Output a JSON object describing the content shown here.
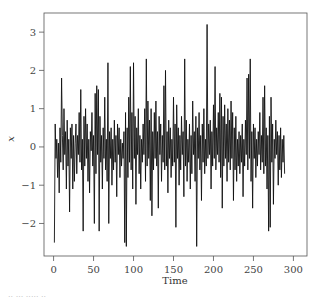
{
  "chart_data": {
    "type": "line",
    "title": "",
    "xlabel": "Time",
    "ylabel": "x",
    "xlim": [
      -12,
      317
    ],
    "ylim": [
      -2.85,
      3.5
    ],
    "xticks": [
      0,
      50,
      100,
      150,
      200,
      250,
      300
    ],
    "yticks": [
      -2,
      -1,
      0,
      1,
      2,
      3
    ],
    "xtick_labels": [
      "0",
      "50",
      "100",
      "150",
      "200",
      "250",
      "300"
    ],
    "ytick_labels": [
      "−2",
      "−1",
      "0",
      "1",
      "2",
      "3"
    ],
    "grid": false,
    "legend": null,
    "series": [
      {
        "name": "x",
        "color": "#111111",
        "x_start": 1,
        "x_step": 1,
        "values": [
          -2.5,
          0.6,
          -0.3,
          0.2,
          -0.8,
          0.1,
          -1.2,
          0.5,
          -0.4,
          1.8,
          0.3,
          -0.6,
          1.0,
          -0.2,
          0.4,
          -1.1,
          0.7,
          -0.5,
          0.2,
          -1.7,
          0.5,
          -0.3,
          0.6,
          -1.1,
          0.3,
          -0.9,
          0.1,
          0.6,
          -0.7,
          0.3,
          -0.2,
          0.9,
          -0.4,
          1.5,
          -0.6,
          0.2,
          -2.2,
          0.8,
          -0.5,
          1.0,
          -0.3,
          0.6,
          -0.9,
          0.2,
          -1.2,
          0.4,
          -0.1,
          0.9,
          -0.5,
          0.3,
          -2.0,
          1.4,
          -0.7,
          1.6,
          -0.2,
          1.5,
          -2.2,
          0.8,
          -0.4,
          0.3,
          -1.1,
          0.5,
          -0.3,
          1.3,
          -0.6,
          0.2,
          -0.9,
          2.2,
          -2.0,
          0.4,
          -0.3,
          0.5,
          -1.0,
          0.2,
          -0.6,
          0.7,
          -0.4,
          0.3,
          -1.3,
          0.6,
          -0.2,
          0.5,
          -0.8,
          0.2,
          -0.5,
          0.1,
          -0.3,
          0.4,
          -2.5,
          0.9,
          -2.6,
          0.5,
          -0.8,
          1.3,
          -0.4,
          2.1,
          -0.6,
          0.9,
          -1.1,
          2.2,
          -0.3,
          0.8,
          -1.5,
          0.5,
          -0.2,
          1.0,
          -0.7,
          0.3,
          -1.1,
          0.2,
          -0.4,
          0.6,
          -0.2,
          1.0,
          -0.9,
          2.3,
          -0.5,
          1.2,
          -0.3,
          0.7,
          -1.4,
          1.0,
          -1.8,
          0.4,
          -0.6,
          0.9,
          -0.3,
          1.2,
          -0.5,
          0.4,
          -1.6,
          0.8,
          -0.2,
          0.6,
          -0.9,
          0.3,
          -0.4,
          1.6,
          -0.6,
          2.0,
          -0.5,
          0.4,
          -1.2,
          0.7,
          -0.3,
          0.5,
          -0.8,
          0.2,
          -0.5,
          1.3,
          -0.4,
          0.6,
          -2.1,
          1.1,
          -0.3,
          0.5,
          -1.0,
          0.3,
          -0.6,
          0.8,
          -0.2,
          0.4,
          -1.3,
          2.3,
          -0.5,
          0.7,
          -0.9,
          0.2,
          -0.4,
          0.6,
          -1.1,
          0.3,
          -0.7,
          1.2,
          -0.2,
          0.4,
          -0.9,
          0.8,
          -2.6,
          0.5,
          -0.3,
          0.9,
          -0.6,
          0.3,
          -1.4,
          0.6,
          -0.4,
          1.0,
          -0.7,
          0.2,
          -0.5,
          3.2,
          -0.3,
          0.6,
          -0.2,
          0.7,
          -1.1,
          0.4,
          -0.5,
          1.1,
          -0.3,
          2.1,
          -0.6,
          0.5,
          -0.2,
          0.9,
          -0.4,
          1.4,
          -0.8,
          1.3,
          -1.6,
          0.8,
          -0.5,
          1.1,
          -0.3,
          0.6,
          -0.9,
          1.0,
          -0.4,
          0.7,
          -0.6,
          1.2,
          -0.3,
          0.9,
          -1.4,
          0.5,
          -0.6,
          0.8,
          -0.9,
          0.2,
          -0.5,
          0.4,
          -0.7,
          0.3,
          -0.4,
          0.6,
          -1.3,
          0.2,
          -0.5,
          0.7,
          -0.2,
          1.8,
          -0.6,
          1.9,
          -0.3,
          2.3,
          -0.9,
          0.4,
          -1.6,
          0.6,
          -0.3,
          0.5,
          -0.8,
          0.2,
          -0.5,
          0.4,
          -0.2,
          0.9,
          -0.6,
          0.3,
          -0.4,
          1.3,
          -0.7,
          1.6,
          -0.5,
          0.5,
          -1.1,
          0.3,
          -2.2,
          0.8,
          -2.1,
          1.3,
          -0.4,
          0.6,
          -1.5,
          0.2,
          -0.3,
          0.7,
          -0.2,
          0.4,
          -1.0,
          0.3,
          -0.6,
          0.5,
          -0.8,
          0.2,
          -0.4,
          0.3,
          -0.7
        ]
      }
    ]
  },
  "caption_fragment": "·· ··· ····· ··"
}
